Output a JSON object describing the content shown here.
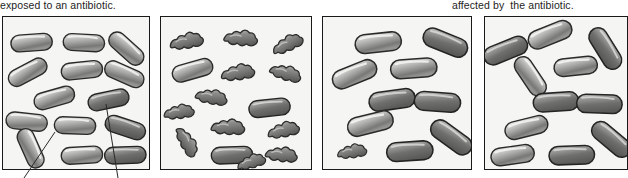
{
  "figure": {
    "type": "illustration",
    "panel_count": 4
  },
  "captions": {
    "left": "exposed to an antibiotic.",
    "right": "affected by  the antibiotic."
  },
  "panels": [
    {
      "id": "panel-1",
      "name": "panel-1-population-before-antibiotic",
      "background": "#f5f5f3",
      "border_color": "#1a1a1a",
      "cells": {
        "healthy_rods": 14,
        "lysed_cells": 0
      },
      "annotation_lines": 2
    },
    {
      "id": "panel-2",
      "name": "panel-2-most-cells-killed",
      "background": "#f5f5f3",
      "border_color": "#1a1a1a",
      "cells": {
        "healthy_rods": 3,
        "lysed_cells": 12
      },
      "annotation_lines": 0
    },
    {
      "id": "panel-3",
      "name": "panel-3-resistant-cells-regrow",
      "background": "#f5f5f3",
      "border_color": "#1a1a1a",
      "cells": {
        "healthy_rods": 9,
        "lysed_cells": 1
      },
      "annotation_lines": 0
    },
    {
      "id": "panel-4",
      "name": "panel-4-resistant-population",
      "background": "#f5f5f3",
      "border_color": "#1a1a1a",
      "cells": {
        "healthy_rods": 12,
        "lysed_cells": 0
      },
      "annotation_lines": 0
    }
  ],
  "colors": {
    "cell_outline": "#2a2a2a",
    "cell_light": "#e8e8e6",
    "cell_mid": "#a9a9a7",
    "cell_dark": "#6d6d6b",
    "lysed_light": "#c9c9c6",
    "lysed_dark": "#5e5e5c",
    "panel_background": "#f5f5f3",
    "text": "#1d1d1d",
    "leader_line": "#2a2a2a"
  },
  "leader_lines": [
    {
      "name": "leader-line-left",
      "x1": 55,
      "y1": 132,
      "x2": 24,
      "y2": 178
    },
    {
      "name": "leader-line-right",
      "x1": 106,
      "y1": 104,
      "x2": 118,
      "y2": 178
    }
  ]
}
